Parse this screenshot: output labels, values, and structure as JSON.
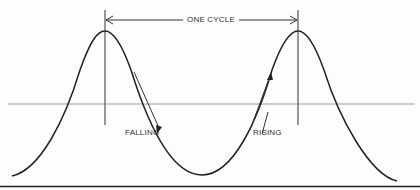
{
  "diagram": {
    "type": "sine-wave-cycle",
    "labels": {
      "cycle": "ONE CYCLE",
      "falling": "FALLING",
      "rising": "RISING"
    },
    "colors": {
      "wave": "#222222",
      "baseline": "#9a9a9a",
      "arrows": "#333333",
      "border": "#222222"
    },
    "geometry": {
      "peak_left_x": 105,
      "peak_right_x": 298,
      "peak_y": 31,
      "trough_x": 202,
      "trough_y": 175,
      "baseline_y": 104
    }
  }
}
